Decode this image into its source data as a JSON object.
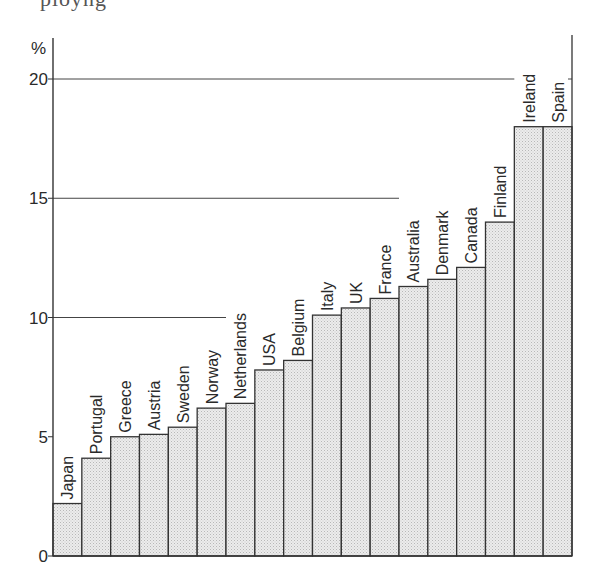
{
  "page": {
    "cut_off_text": "ployng"
  },
  "chart_data": {
    "type": "bar",
    "title": "",
    "xlabel": "",
    "ylabel": "%",
    "ylim": [
      0,
      20
    ],
    "yticks": [
      0,
      5,
      10,
      15,
      20
    ],
    "grid": "partial horizontal lines at 10, 15, 20 (each ending where bars reach that level)",
    "legend": "none",
    "bar_fill": "#e6e6e6",
    "bar_stroke": "#333333",
    "categories": [
      "Japan",
      "Portugal",
      "Greece",
      "Austria",
      "Sweden",
      "Norway",
      "Netherlands",
      "USA",
      "Belgium",
      "Italy",
      "UK",
      "France",
      "Australia",
      "Denmark",
      "Canada",
      "Finland",
      "Ireland",
      "Spain"
    ],
    "values": [
      2.2,
      4.1,
      5.0,
      5.1,
      5.4,
      6.2,
      6.4,
      7.8,
      8.2,
      10.1,
      10.4,
      10.8,
      11.3,
      11.6,
      12.1,
      14.0,
      18.0,
      18.0
    ]
  }
}
